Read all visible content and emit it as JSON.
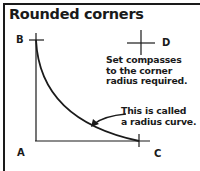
{
  "title": "Rounded corners",
  "points": {
    "A": "A",
    "B": "B",
    "C": "C",
    "D": "D"
  },
  "annotations": {
    "compass_note": [
      "Set compasses",
      "to the corner",
      "radius required."
    ],
    "curve_note": [
      "This is called",
      "a radius curve."
    ]
  },
  "colors": {
    "ink": "#1a1a1a",
    "background": "#ffffff"
  }
}
